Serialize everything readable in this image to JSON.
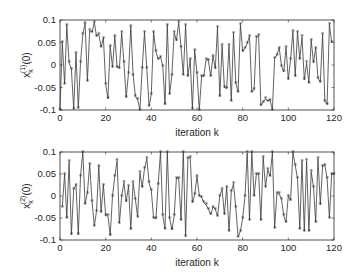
{
  "colors": {
    "line": "#3a3a3a",
    "axis": "#262626",
    "background": "#ffffff"
  },
  "chart_data": [
    {
      "type": "line",
      "title": "",
      "xlabel": "iteration k",
      "ylabel": "x_k^(1)(0)",
      "ylabel_base": "x",
      "ylabel_sup": "(1)",
      "ylabel_sub": "k",
      "ylabel_rest": "(0)",
      "xlim": [
        0,
        120
      ],
      "ylim": [
        -0.1,
        0.1
      ],
      "xticks": [
        0,
        20,
        40,
        60,
        80,
        100,
        120
      ],
      "yticks": [
        -0.1,
        -0.05,
        0,
        0.05,
        0.1
      ],
      "ytick_labels": [
        "-0.1",
        "-0.05",
        "0",
        "0.05",
        "0.1"
      ],
      "marker": "asterisk",
      "grid": false,
      "x": [
        0,
        1,
        2,
        3,
        4,
        5,
        6,
        7,
        8,
        9,
        10,
        11,
        12,
        13,
        14,
        15,
        16,
        17,
        18,
        19,
        20,
        21,
        22,
        23,
        24,
        25,
        26,
        27,
        28,
        29,
        30,
        31,
        32,
        33,
        34,
        35,
        36,
        37,
        38,
        39,
        40,
        41,
        42,
        43,
        44,
        45,
        46,
        47,
        48,
        49,
        50,
        51,
        52,
        53,
        54,
        55,
        56,
        57,
        58,
        59,
        60,
        61,
        62,
        63,
        64,
        65,
        66,
        67,
        68,
        69,
        70,
        71,
        72,
        73,
        74,
        75,
        76,
        77,
        78,
        79,
        80,
        81,
        82,
        83,
        84,
        85,
        86,
        87,
        88,
        89,
        90,
        91,
        92,
        93,
        94,
        95,
        96,
        97,
        98,
        99,
        100,
        101,
        102,
        103,
        104,
        105,
        106,
        107,
        108,
        109,
        110,
        111,
        112,
        113,
        114,
        115,
        116,
        117,
        118,
        119,
        120
      ],
      "values": [
        -0.1,
        0.05,
        -0.042,
        0.088,
        0.005,
        -0.01,
        -0.098,
        0.026,
        -0.096,
        0.005,
        0.068,
        0.093,
        -0.036,
        0.076,
        0.073,
        0.095,
        0.064,
        0.068,
        0.04,
        0.06,
        -0.043,
        -0.075,
        0.042,
        -0.005,
        0.064,
        -0.005,
        -0.007,
        0.072,
        0.006,
        -0.072,
        -0.018,
        0.086,
        -0.022,
        -0.07,
        -0.077,
        -0.1,
        -0.007,
        0.073,
        -0.008,
        -0.091,
        -0.065,
        0.073,
        0.03,
        0.013,
        0.018,
        -0.003,
        -0.088,
        0.089,
        -0.065,
        -0.022,
        0.072,
        0.054,
        0.094,
        0.04,
        -0.022,
        0.088,
        -0.025,
        0.013,
        -0.098,
        0.033,
        -0.019,
        -0.1,
        -0.025,
        -0.025,
        0.012,
        0.01,
        -0.025,
        0.02,
        -0.008,
        0.084,
        -0.07,
        0.043,
        -0.05,
        -0.052,
        0.043,
        -0.08,
        0.07,
        -0.04,
        -0.06,
        0.09,
        0.03,
        0.037,
        0.048,
        0.064,
        -0.06,
        -0.055,
        0.062,
        0.066,
        -0.09,
        -0.083,
        -0.075,
        -0.08,
        -0.078,
        -0.1,
        0.015,
        0.022,
        0.038,
        -0.002,
        -0.015,
        0.039,
        -0.032,
        0.012,
        0.075,
        -0.025,
        0.073,
        0.013,
        0.063,
        -0.033,
        0.005,
        -0.04,
        0.055,
        0.005,
        0.038,
        -0.03,
        -0.038,
        0.068,
        -0.08,
        -0.088,
        0.09,
        0.05
      ]
    },
    {
      "type": "line",
      "title": "",
      "xlabel": "iteration k",
      "ylabel": "x_k^(2)(0)",
      "ylabel_base": "x",
      "ylabel_sup": "(2)",
      "ylabel_sub": "k",
      "ylabel_rest": "(0)",
      "xlim": [
        0,
        120
      ],
      "ylim": [
        -0.1,
        0.1
      ],
      "xticks": [
        0,
        20,
        40,
        60,
        80,
        100,
        120
      ],
      "yticks": [
        -0.1,
        -0.05,
        0,
        0.05,
        0.1
      ],
      "ytick_labels": [
        "-0.1",
        "-0.05",
        "0",
        "0.05",
        "0.1"
      ],
      "marker": "asterisk",
      "grid": false,
      "x": [
        1,
        2,
        3,
        4,
        5,
        6,
        7,
        8,
        9,
        10,
        11,
        12,
        13,
        14,
        15,
        16,
        17,
        18,
        19,
        20,
        21,
        22,
        23,
        24,
        25,
        26,
        27,
        28,
        29,
        30,
        31,
        32,
        33,
        34,
        35,
        36,
        37,
        38,
        39,
        40,
        41,
        42,
        43,
        44,
        45,
        46,
        47,
        48,
        49,
        50,
        51,
        52,
        53,
        54,
        55,
        56,
        57,
        58,
        59,
        60,
        61,
        62,
        63,
        64,
        65,
        66,
        67,
        68,
        69,
        70,
        71,
        72,
        73,
        74,
        75,
        76,
        77,
        78,
        79,
        80,
        81,
        82,
        83,
        84,
        85,
        86,
        87,
        88,
        89,
        90,
        91,
        92,
        93,
        94,
        95,
        96,
        97,
        98,
        99,
        100,
        101,
        102,
        103,
        104,
        105,
        106,
        107,
        108,
        109,
        110,
        111,
        112,
        113,
        114,
        115,
        116,
        117,
        118,
        119,
        120
      ],
      "values": [
        -0.025,
        0.05,
        -0.05,
        0.078,
        -0.088,
        0.015,
        0.025,
        -0.088,
        0.045,
        0.1,
        -0.018,
        0.007,
        0.072,
        -0.012,
        -0.068,
        -0.035,
        0.068,
        -0.037,
        0.025,
        -0.045,
        -0.045,
        -0.09,
        0.0,
        0.045,
        0.08,
        -0.062,
        0.0,
        0.03,
        -0.013,
        0.022,
        -0.076,
        0.03,
        -0.007,
        -0.048,
        0.053,
        0.02,
        0.062,
        0.085,
        0.03,
        0.012,
        -0.05,
        -0.052,
        0.027,
        0.1,
        -0.045,
        -0.075,
        0.1,
        -0.05,
        -0.077,
        -0.045,
        0.04,
        0.04,
        -0.055,
        0.1,
        -0.092,
        0.085,
        0.088,
        -0.015,
        0.003,
        0.045,
        0.0,
        -0.003,
        -0.015,
        -0.02,
        -0.03,
        -0.042,
        -0.025,
        -0.03,
        -0.046,
        0.0,
        0.015,
        -0.042,
        0.02,
        -0.08,
        0.01,
        0.028,
        -0.027,
        -0.093,
        -0.08,
        -0.05,
        0.0,
        0.098,
        -0.055,
        0.1,
        0.0,
        0.05,
        0.05,
        -0.055,
        0.088,
        0.02,
        0.06,
        0.045,
        0.1,
        -0.073,
        0.005,
        0.005,
        -0.008,
        -0.045,
        -0.06,
        0.0,
        -0.01,
        0.1,
        0.07,
        0.04,
        -0.075,
        0.078,
        -0.08,
        0.08,
        -0.08,
        0.055,
        0.02,
        -0.06,
        0.085,
        -0.02,
        0.068,
        0.07,
        0.04,
        -0.05,
        0.05,
        0.05
      ]
    }
  ]
}
